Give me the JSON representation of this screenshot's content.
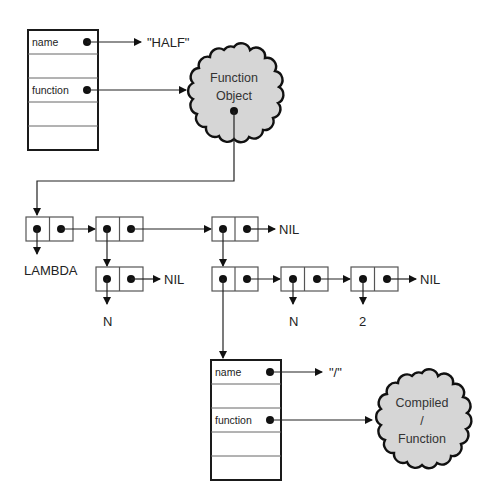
{
  "diagram": {
    "symbol_half": {
      "slots": [
        "name",
        "",
        "function",
        "",
        ""
      ],
      "name_value": "\"HALF\"",
      "function_target": [
        "Function",
        "Object"
      ]
    },
    "list": {
      "lambda_label": "LAMBDA",
      "param_label": "N",
      "nil_1": "NIL",
      "nil_2": "NIL",
      "nil_3": "NIL",
      "arg_n": "N",
      "arg_2": "2"
    },
    "symbol_div": {
      "slots": [
        "name",
        "",
        "function",
        "",
        ""
      ],
      "name_value": "\"/\"",
      "function_target": [
        "Compiled",
        "/",
        "Function"
      ]
    }
  }
}
